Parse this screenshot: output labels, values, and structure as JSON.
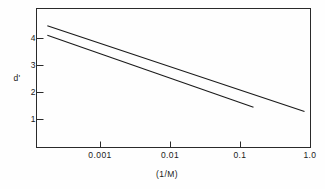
{
  "chart_data": {
    "type": "line",
    "title": "",
    "subtitle": "",
    "xlabel": "(1/M)",
    "ylabel": "d'",
    "xscale": "log",
    "yscale": "linear",
    "xlim": [
      0.0002,
      1.0
    ],
    "ylim": [
      0.35,
      4.6
    ],
    "grid": false,
    "legend": null,
    "xticks": [
      {
        "value": 0.001,
        "label": "0.001"
      },
      {
        "value": 0.01,
        "label": "0.01"
      },
      {
        "value": 0.1,
        "label": "0.1"
      },
      {
        "value": 1.0,
        "label": "1.0"
      }
    ],
    "yticks": [
      {
        "value": 1,
        "label": "1"
      },
      {
        "value": 2,
        "label": "2"
      },
      {
        "value": 3,
        "label": "3"
      },
      {
        "value": 4,
        "label": "4"
      }
    ],
    "series": [
      {
        "name": "upper-line",
        "x": [
          0.00028,
          0.83
        ],
        "y": [
          4.07,
          1.45
        ],
        "points": [
          {
            "x": 0.00028,
            "y": 4.07
          },
          {
            "x": 0.83,
            "y": 1.45
          }
        ]
      },
      {
        "name": "lower-line",
        "x": [
          0.00028,
          0.17
        ],
        "y": [
          3.78,
          1.58
        ],
        "points": [
          {
            "x": 0.00028,
            "y": 3.78
          },
          {
            "x": 0.17,
            "y": 1.58
          }
        ]
      }
    ],
    "colors": {
      "line": "#1a1a1a",
      "axis": "#2a2a2a",
      "background": "#fefefe",
      "text": "#1a1a1a"
    },
    "annotations": []
  }
}
